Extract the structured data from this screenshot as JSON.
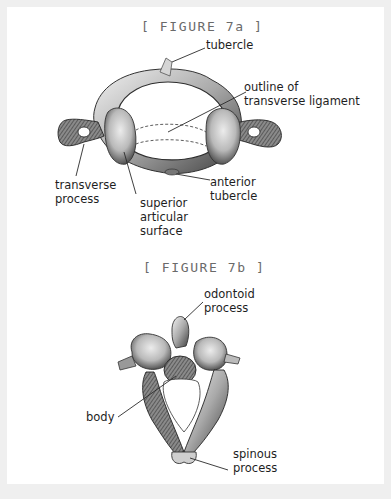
{
  "figure_a": {
    "caption": "[ FIGURE 7a ]",
    "labels": {
      "tubercle": "tubercle",
      "transverse_ligament": "outline of\ntransverse ligament",
      "transverse_process": "transverse\nprocess",
      "superior_articular_surface": "superior\narticular\nsurface",
      "anterior_tubercle": "anterior\ntubercle"
    }
  },
  "figure_b": {
    "caption": "[ FIGURE 7b ]",
    "labels": {
      "odontoid_process": "odontoid\nprocess",
      "body": "body",
      "spinous_process": "spinous\nprocess"
    }
  },
  "colors": {
    "background": "#efefef",
    "panel": "#ffffff",
    "caption": "#6a6a6a",
    "label": "#1e1e1e",
    "bone_light": "#d8d8d8",
    "bone_dark": "#4a4a4a"
  }
}
